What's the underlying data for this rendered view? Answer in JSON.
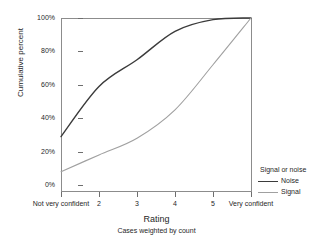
{
  "chart_data": {
    "type": "line",
    "title": "",
    "xlabel": "Rating",
    "ylabel": "Cumulative percent",
    "footnote": "Cases weighted by count",
    "categories": [
      "Not very confident",
      "2",
      "3",
      "4",
      "5",
      "Very confident"
    ],
    "x_tick_labels": [
      "Not very confident",
      "2",
      "3",
      "4",
      "5",
      "Very confident"
    ],
    "y_tick_labels": [
      "0%",
      "20%",
      "40%",
      "60%",
      "80%",
      "100%"
    ],
    "y_tick_values": [
      0,
      20,
      40,
      60,
      80,
      100
    ],
    "ylim": [
      0,
      100
    ],
    "grid": false,
    "legend_position": "right",
    "legend_title": "Signal or noise",
    "series": [
      {
        "name": "Noise",
        "color": "#3b3b3b",
        "values": [
          29,
          59,
          75,
          92,
          99,
          100
        ]
      },
      {
        "name": "Signal",
        "color": "#a0a0a0",
        "values": [
          8,
          18,
          28,
          45,
          72,
          100
        ]
      }
    ]
  },
  "axes": {
    "y_title": "Cumulative percent",
    "x_title": "Rating",
    "x_subtitle": "Cases weighted by count"
  },
  "legend": {
    "title": "Signal or noise",
    "entries": [
      {
        "label": "Noise",
        "color": "#3b3b3b"
      },
      {
        "label": "Signal",
        "color": "#a0a0a0"
      }
    ]
  }
}
